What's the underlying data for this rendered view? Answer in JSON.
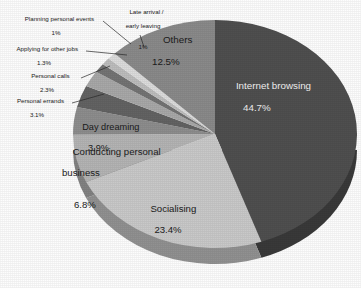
{
  "chart_data": {
    "type": "pie",
    "title": "",
    "subtitle": "",
    "legend_position": "labels-on-slices",
    "grid": false,
    "unit": "%",
    "categories": [
      "Internet browsing",
      "Socialising",
      "Conducting personal business",
      "Day dreaming",
      "Personal errands",
      "Personal calls",
      "Applying for other jobs",
      "Planning personal events",
      "Late arrival / early leaving",
      "Others"
    ],
    "values": [
      44.7,
      23.4,
      6.8,
      3.9,
      3.1,
      2.3,
      1.3,
      1.0,
      1.0,
      12.5
    ],
    "slices": [
      {
        "label": "Internet browsing",
        "value": 44.7,
        "value_text": "44.7%",
        "color": "#4f4f4f",
        "placement": "inside"
      },
      {
        "label": "Socialising",
        "value": 23.4,
        "value_text": "23.4%",
        "color": "#c9c9c9",
        "placement": "inside"
      },
      {
        "label": "Conducting personal business",
        "value": 6.8,
        "value_text": "6.8%",
        "color": "#b4b4b4",
        "placement": "inside"
      },
      {
        "label": "Day dreaming",
        "value": 3.9,
        "value_text": "3.9%",
        "color": "#8d8d8d",
        "placement": "inside"
      },
      {
        "label": "Personal errands",
        "value": 3.1,
        "value_text": "3.1%",
        "color": "#636363",
        "placement": "callout"
      },
      {
        "label": "Personal calls",
        "value": 2.3,
        "value_text": "2.3%",
        "color": "#a8a8a8",
        "placement": "callout"
      },
      {
        "label": "Applying for other jobs",
        "value": 1.3,
        "value_text": "1.3%",
        "color": "#747474",
        "placement": "callout"
      },
      {
        "label": "Planning personal events",
        "value": 1.0,
        "value_text": "1%",
        "color": "#bdbdbd",
        "placement": "callout"
      },
      {
        "label": "Late arrival / early leaving",
        "value": 1.0,
        "value_text": "1%",
        "color": "#dcdcdc",
        "placement": "callout"
      },
      {
        "label": "Others",
        "value": 12.5,
        "value_text": "12.5%",
        "color": "#8a8a8a",
        "placement": "inside"
      }
    ],
    "labels": {
      "internet_browsing": {
        "name": "Internet browsing",
        "pct": "44.7%"
      },
      "socialising": {
        "name": "Socialising",
        "pct": "23.4%"
      },
      "conducting_l1": {
        "name": "Conducting personal",
        "l2": "business",
        "pct": "6.8%"
      },
      "day_dreaming": {
        "name": "Day dreaming",
        "pct": "3.9%"
      },
      "personal_errands": {
        "name": "Personal errands",
        "pct": "3.1%"
      },
      "personal_calls": {
        "name": "Personal calls",
        "pct": "2.3%"
      },
      "applying_jobs": {
        "name": "Applying for other jobs",
        "pct": "1.3%"
      },
      "planning_events": {
        "name": "Planning personal events",
        "pct": "1%"
      },
      "late_arrival": {
        "name": "Late arrival /",
        "l2": "early leaving",
        "pct": "1%"
      },
      "others": {
        "name": "Others",
        "pct": "12.5%"
      }
    },
    "geometry": {
      "cx": 215,
      "cy": 134,
      "rx": 142,
      "ry": 114,
      "depth": 16,
      "start_angle_deg": -90,
      "direction": "clockwise"
    },
    "palette": {
      "background": "#fdfdfd",
      "text": "#1b1b1b",
      "outline": "#2a2a2a"
    }
  }
}
